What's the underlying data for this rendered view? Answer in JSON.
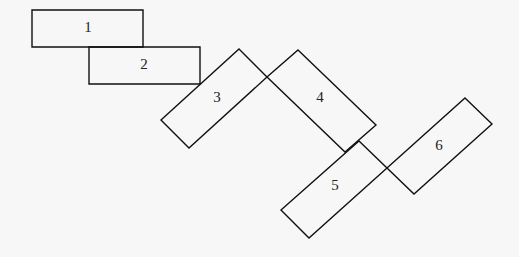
{
  "diagram": {
    "background": "#f7f7f7",
    "stroke_color": "#111111",
    "rectangles": [
      {
        "label": "1",
        "points": "32,10 143,10 143,47 32,47",
        "label_pos": [
          88,
          29
        ]
      },
      {
        "label": "2",
        "points": "89,47 200,47 200,84 89,84",
        "label_pos": [
          144,
          66
        ]
      },
      {
        "label": "3",
        "points": "239,49 267,77 189,148 161,120",
        "label_pos": [
          217,
          99
        ]
      },
      {
        "label": "4",
        "points": "298,50 376,125 345,152 267,77",
        "label_pos": [
          320,
          99
        ]
      },
      {
        "label": "5",
        "points": "359,141 387,168 309,238 281,210",
        "label_pos": [
          335,
          187
        ]
      },
      {
        "label": "6",
        "points": "465,98 492,124 414,194 387,168",
        "label_pos": [
          439,
          147
        ]
      }
    ]
  }
}
